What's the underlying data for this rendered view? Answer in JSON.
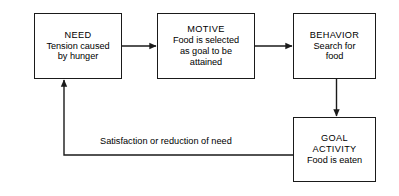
{
  "diagram": {
    "type": "flowchart",
    "background_color": "#ffffff",
    "line_color": "#1a1a1a",
    "text_color": "#000000",
    "nodes": [
      {
        "id": "need",
        "title": "NEED",
        "lines": [
          "Tension caused",
          "by hunger"
        ]
      },
      {
        "id": "motive",
        "title": "MOTIVE",
        "lines": [
          "Food is selected",
          "as goal to be",
          "attained"
        ]
      },
      {
        "id": "behavior",
        "title": "BEHAVIOR",
        "lines": [
          "Search for",
          "food"
        ]
      },
      {
        "id": "goal",
        "title": "GOAL",
        "title2": "ACTIVITY",
        "lines": [
          "Food is eaten"
        ]
      }
    ],
    "edges": [
      {
        "id": "need-to-motive",
        "from": "need",
        "to": "motive",
        "label": ""
      },
      {
        "id": "motive-to-behavior",
        "from": "motive",
        "to": "behavior",
        "label": ""
      },
      {
        "id": "behavior-to-goal",
        "from": "behavior",
        "to": "goal",
        "label": ""
      },
      {
        "id": "goal-to-need",
        "from": "goal",
        "to": "need",
        "label": "Satisfaction or reduction of need"
      }
    ],
    "feedback_label": "Satisfaction or reduction of need"
  }
}
